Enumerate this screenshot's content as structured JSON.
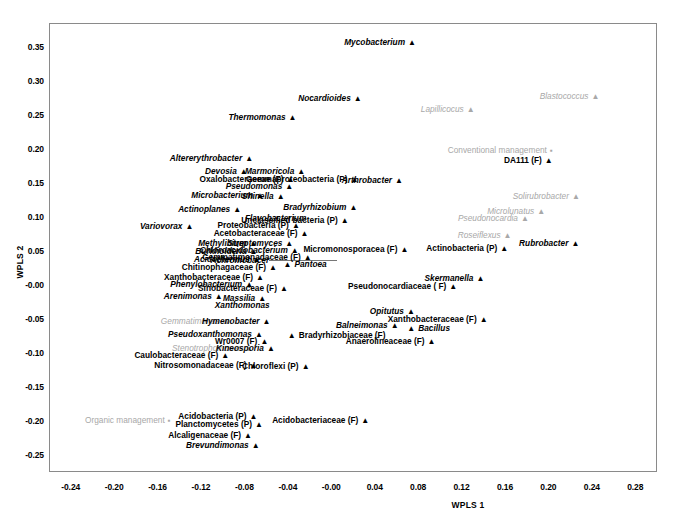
{
  "chart_data": {
    "type": "scatter",
    "title": "",
    "xlabel": "WPLS 1",
    "ylabel": "WPLS 2",
    "xlim": [
      -0.26,
      0.3
    ],
    "ylim": [
      -0.275,
      0.385
    ],
    "xticks": [
      "-0.24",
      "-0.20",
      "-0.16",
      "-0.12",
      "-0.08",
      "-0.04",
      "-0.00",
      "0.04",
      "0.08",
      "0.12",
      "0.16",
      "0.20",
      "0.24",
      "0.28"
    ],
    "xtick_values": [
      -0.24,
      -0.2,
      -0.16,
      -0.12,
      -0.08,
      -0.04,
      0.0,
      0.04,
      0.08,
      0.12,
      0.16,
      0.2,
      0.24,
      0.28
    ],
    "yticks": [
      "0.35",
      "0.30",
      "0.25",
      "0.20",
      "0.15",
      "0.10",
      "0.05",
      "-0.00",
      "-0.05",
      "-0.10",
      "-0.15",
      "-0.20",
      "-0.25"
    ],
    "ytick_values": [
      0.35,
      0.3,
      0.25,
      0.2,
      0.15,
      0.1,
      0.05,
      0.0,
      -0.05,
      -0.1,
      -0.15,
      -0.2,
      -0.25
    ],
    "grid": false,
    "legend": "none",
    "marker_triangle": "▲",
    "marker_square": "▪",
    "points": [
      {
        "label": "Mycobacterium",
        "x": 0.078,
        "y": 0.357,
        "style": "italic",
        "color": "black",
        "anchor": "right"
      },
      {
        "label": "Nocardioides",
        "x": 0.028,
        "y": 0.275,
        "style": "italic",
        "color": "black",
        "anchor": "right"
      },
      {
        "label": "Blastococcus",
        "x": 0.247,
        "y": 0.278,
        "style": "italic",
        "color": "gray",
        "anchor": "right"
      },
      {
        "label": "Lapillicocus",
        "x": 0.132,
        "y": 0.258,
        "style": "italic",
        "color": "gray",
        "anchor": "right"
      },
      {
        "label": "Thermomonas",
        "x": -0.032,
        "y": 0.247,
        "style": "italic",
        "color": "black",
        "anchor": "right"
      },
      {
        "label": "Conventional management",
        "x": 0.204,
        "y": 0.199,
        "style": "plain",
        "color": "gray",
        "anchor": "right",
        "marker": "square"
      },
      {
        "label": "DA111 (F)",
        "x": 0.204,
        "y": 0.184,
        "style": "plain",
        "color": "black",
        "anchor": "right"
      },
      {
        "label": "Altererythrobacter",
        "x": -0.072,
        "y": 0.186,
        "style": "italic",
        "color": "black",
        "anchor": "right"
      },
      {
        "label": "Devosia",
        "x": -0.077,
        "y": 0.168,
        "style": "italic",
        "color": "black",
        "anchor": "right"
      },
      {
        "label": "Marmoricola",
        "x": -0.024,
        "y": 0.168,
        "style": "italic",
        "color": "black",
        "anchor": "right"
      },
      {
        "label": "Oxalobacteraceae  (F)",
        "x": -0.034,
        "y": 0.156,
        "style": "plain",
        "color": "black",
        "anchor": "right"
      },
      {
        "label": "Gemmaproteobacteria (P)",
        "x": 0.025,
        "y": 0.156,
        "style": "plain",
        "color": "black",
        "anchor": "right"
      },
      {
        "label": "Arthrobacter",
        "x": 0.066,
        "y": 0.154,
        "style": "italic",
        "color": "black",
        "anchor": "right"
      },
      {
        "label": "Pseudomonas",
        "x": -0.035,
        "y": 0.146,
        "style": "italic",
        "color": "black",
        "anchor": "right"
      },
      {
        "label": "Microbacterium",
        "x": -0.062,
        "y": 0.132,
        "style": "italic",
        "color": "black",
        "anchor": "right"
      },
      {
        "label": "Shinella",
        "x": -0.043,
        "y": 0.13,
        "style": "italic",
        "color": "black",
        "anchor": "right"
      },
      {
        "label": "Solirubrobacter",
        "x": 0.229,
        "y": 0.131,
        "style": "italic",
        "color": "gray",
        "anchor": "right"
      },
      {
        "label": "Actinoplanes",
        "x": -0.083,
        "y": 0.112,
        "style": "italic",
        "color": "black",
        "anchor": "right"
      },
      {
        "label": "Bradyrhizobium",
        "x": 0.024,
        "y": 0.114,
        "style": "italic",
        "color": "black",
        "anchor": "right"
      },
      {
        "label": "Microlunatus",
        "x": 0.197,
        "y": 0.108,
        "style": "italic",
        "color": "gray",
        "anchor": "right"
      },
      {
        "label": "Pseudonocardia",
        "x": 0.182,
        "y": 0.098,
        "style": "italic",
        "color": "gray",
        "anchor": "right"
      },
      {
        "label": "Flavobacterium",
        "x": -0.023,
        "y": 0.098,
        "style": "italic",
        "color": "black",
        "anchor": "right_nomark"
      },
      {
        "label": "Unclassified bacteria (P)",
        "x": 0.016,
        "y": 0.095,
        "style": "plain",
        "color": "black",
        "anchor": "right"
      },
      {
        "label": "Variovorax",
        "x": -0.127,
        "y": 0.086,
        "style": "italic",
        "color": "black",
        "anchor": "right"
      },
      {
        "label": "Proteobacteria (P)",
        "x": -0.029,
        "y": 0.088,
        "style": "plain",
        "color": "black",
        "anchor": "right"
      },
      {
        "label": "Acetobacteraceae (F)",
        "x": -0.021,
        "y": 0.077,
        "style": "plain",
        "color": "black",
        "anchor": "right"
      },
      {
        "label": "Roseiflexus",
        "x": 0.166,
        "y": 0.073,
        "style": "italic",
        "color": "gray",
        "anchor": "right"
      },
      {
        "label": "Rubrobacter",
        "x": 0.173,
        "y": 0.062,
        "style": "italic",
        "color": "black",
        "anchor": "left"
      },
      {
        "label": "Methylibium",
        "x": -0.068,
        "y": 0.062,
        "style": "italic",
        "color": "black",
        "anchor": "right"
      },
      {
        "label": "Streptomyces",
        "x": -0.035,
        "y": 0.062,
        "style": "italic",
        "color": "black",
        "anchor": "right"
      },
      {
        "label": "Actinobacteria (P)",
        "x": 0.163,
        "y": 0.054,
        "style": "plain",
        "color": "black",
        "anchor": "right"
      },
      {
        "label": "Burkholderia",
        "x": -0.068,
        "y": 0.05,
        "style": "italic",
        "color": "black",
        "anchor": "right"
      },
      {
        "label": "Chloroacidobacterium",
        "x": -0.03,
        "y": 0.051,
        "style": "italic",
        "color": "black",
        "anchor": "right"
      },
      {
        "label": "Achromobacer",
        "x": -0.118,
        "y": 0.036,
        "style": "italic",
        "color": "black",
        "anchor": "leader"
      },
      {
        "label": "Acidothermus",
        "x": -0.065,
        "y": 0.038,
        "style": "italic",
        "color": "black",
        "anchor": "right"
      },
      {
        "label": "Gemmatimonadaceae (F)",
        "x": -0.018,
        "y": 0.041,
        "style": "plain",
        "color": "black",
        "anchor": "right"
      },
      {
        "label": "Micromonosporacea (F)",
        "x": 0.071,
        "y": 0.053,
        "style": "plain",
        "color": "black",
        "anchor": "right"
      },
      {
        "label": "Pantoea",
        "x": -0.044,
        "y": 0.031,
        "style": "italic",
        "color": "black",
        "anchor": "left",
        "marker": "triangle_first"
      },
      {
        "label": "Chitinophagaceae  (F)",
        "x": -0.05,
        "y": 0.026,
        "style": "plain",
        "color": "black",
        "anchor": "right"
      },
      {
        "label": "Xanthobacteraceae (F)",
        "x": -0.062,
        "y": 0.012,
        "style": "plain",
        "color": "black",
        "anchor": "right"
      },
      {
        "label": "Skermanella",
        "x": 0.141,
        "y": 0.01,
        "style": "italic",
        "color": "black",
        "anchor": "right"
      },
      {
        "label": "Pseudonocardiaceae ( F)",
        "x": 0.116,
        "y": -0.001,
        "style": "plain",
        "color": "black",
        "anchor": "right"
      },
      {
        "label": "Phenylobacterium",
        "x": -0.072,
        "y": 0.001,
        "style": "italic",
        "color": "black",
        "anchor": "right"
      },
      {
        "label": "Sinobacteraceae (F)",
        "x": -0.04,
        "y": -0.005,
        "style": "plain",
        "color": "black",
        "anchor": "right"
      },
      {
        "label": "Arenimonas",
        "x": -0.1,
        "y": -0.017,
        "style": "italic",
        "color": "black",
        "anchor": "right"
      },
      {
        "label": "Massilia",
        "x": -0.06,
        "y": -0.019,
        "style": "italic",
        "color": "black",
        "anchor": "right"
      },
      {
        "label": "Xanthomonas",
        "x": -0.082,
        "y": -0.029,
        "style": "italic",
        "color": "black",
        "anchor": "center_nomark"
      },
      {
        "label": "Opitutus",
        "x": 0.077,
        "y": -0.039,
        "style": "italic",
        "color": "black",
        "anchor": "right"
      },
      {
        "label": "Xanthobacteraceae (F)",
        "x": 0.144,
        "y": -0.05,
        "style": "plain",
        "color": "black",
        "anchor": "right"
      },
      {
        "label": "Gemmatimonas",
        "x": -0.093,
        "y": -0.053,
        "style": "italic",
        "color": "gray",
        "anchor": "right"
      },
      {
        "label": "Hymenobacter",
        "x": -0.056,
        "y": -0.053,
        "style": "italic",
        "color": "black",
        "anchor": "right"
      },
      {
        "label": "Balneimonas",
        "x": 0.062,
        "y": -0.059,
        "style": "italic",
        "color": "black",
        "anchor": "right"
      },
      {
        "label": "Bacillus",
        "x": 0.07,
        "y": -0.063,
        "style": "italic",
        "color": "black",
        "anchor": "left",
        "marker": "triangle_first"
      },
      {
        "label": "Pseudoxanthomonas",
        "x": -0.063,
        "y": -0.072,
        "style": "italic",
        "color": "black",
        "anchor": "right"
      },
      {
        "label": "Bradyrhizobiaceae (F)",
        "x": -0.04,
        "y": -0.073,
        "style": "plain",
        "color": "black",
        "anchor": "left",
        "marker": "triangle_first"
      },
      {
        "label": "Wr0007 (F)",
        "x": -0.058,
        "y": -0.082,
        "style": "plain",
        "color": "black",
        "anchor": "right"
      },
      {
        "label": "Anaerolineaceae (F)",
        "x": 0.096,
        "y": -0.082,
        "style": "plain",
        "color": "black",
        "anchor": "right"
      },
      {
        "label": "Stenotrophomonas",
        "x": -0.072,
        "y": -0.092,
        "style": "italic",
        "color": "gray",
        "anchor": "right"
      },
      {
        "label": "Kineosporia",
        "x": -0.052,
        "y": -0.092,
        "style": "italic",
        "color": "black",
        "anchor": "right"
      },
      {
        "label": "Caulobacteraceae (F)",
        "x": -0.094,
        "y": -0.103,
        "style": "plain",
        "color": "black",
        "anchor": "right"
      },
      {
        "label": "Nitrosomonadaceae  (F)",
        "x": -0.068,
        "y": -0.117,
        "style": "plain",
        "color": "black",
        "anchor": "right"
      },
      {
        "label": "Chloroflexi  (P)",
        "x": -0.02,
        "y": -0.119,
        "style": "plain",
        "color": "black",
        "anchor": "right"
      },
      {
        "label": "Organic management",
        "x": -0.148,
        "y": -0.199,
        "style": "plain",
        "color": "gray",
        "anchor": "right",
        "marker": "square"
      },
      {
        "label": "Acidobacteria (P)",
        "x": -0.068,
        "y": -0.192,
        "style": "plain",
        "color": "black",
        "anchor": "right"
      },
      {
        "label": "Acidobacteriaceae (F)",
        "x": 0.035,
        "y": -0.199,
        "style": "plain",
        "color": "black",
        "anchor": "right"
      },
      {
        "label": "Planctomycetes (P)",
        "x": -0.063,
        "y": -0.205,
        "style": "plain",
        "color": "black",
        "anchor": "right"
      },
      {
        "label": "Alcaligenaceae  (F)",
        "x": -0.073,
        "y": -0.22,
        "style": "plain",
        "color": "black",
        "anchor": "right"
      },
      {
        "label": "Brevundimonas",
        "x": -0.066,
        "y": -0.236,
        "style": "italic",
        "color": "black",
        "anchor": "right"
      }
    ]
  }
}
